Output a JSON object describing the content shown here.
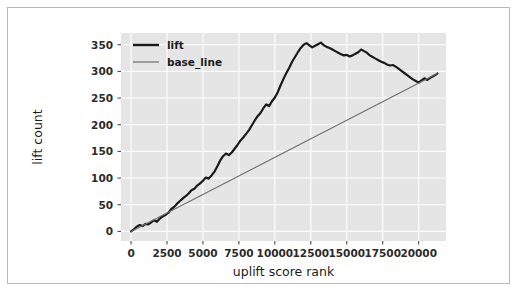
{
  "figure": {
    "background": "#ffffff",
    "border_color": "#b8bbbe",
    "plot_bg": "#e5e5e5",
    "grid_color": "#ffffff"
  },
  "ghost_text": "",
  "chart_data": {
    "type": "line",
    "title": "",
    "xlabel": "uplift score rank",
    "ylabel": "lift count",
    "xlim": [
      -700,
      21900
    ],
    "ylim": [
      -18,
      372
    ],
    "grid": true,
    "legend_position": "upper left",
    "xticks": [
      0,
      2500,
      5000,
      7500,
      10000,
      12500,
      15000,
      17500,
      20000
    ],
    "xtick_labels": [
      "0",
      "2500",
      "5000",
      "7500",
      "10000",
      "12500",
      "15000",
      "17500",
      "20000"
    ],
    "yticks": [
      0,
      50,
      100,
      150,
      200,
      250,
      300,
      350
    ],
    "ytick_labels": [
      "0",
      "50",
      "100",
      "150",
      "200",
      "250",
      "300",
      "350"
    ],
    "series": [
      {
        "name": "lift",
        "color": "#1a1a1a",
        "width": 2.2,
        "x": [
          0,
          200,
          400,
          600,
          800,
          1000,
          1200,
          1400,
          1600,
          1800,
          2000,
          2200,
          2400,
          2600,
          2800,
          3000,
          3200,
          3400,
          3600,
          3800,
          4000,
          4200,
          4400,
          4600,
          4800,
          5000,
          5200,
          5400,
          5600,
          5800,
          6000,
          6200,
          6400,
          6600,
          6800,
          7000,
          7200,
          7400,
          7600,
          7800,
          8000,
          8200,
          8400,
          8600,
          8800,
          9000,
          9200,
          9400,
          9600,
          9800,
          10000,
          10200,
          10400,
          10600,
          10800,
          11000,
          11200,
          11400,
          11600,
          11800,
          12000,
          12200,
          12400,
          12600,
          12800,
          13000,
          13200,
          13400,
          13600,
          13800,
          14000,
          14200,
          14400,
          14600,
          14800,
          15000,
          15200,
          15400,
          15600,
          15800,
          16000,
          16200,
          16400,
          16600,
          16800,
          17000,
          17200,
          17400,
          17600,
          17800,
          18000,
          18200,
          18400,
          18600,
          18800,
          19000,
          19200,
          19400,
          19600,
          19800,
          20000,
          20200,
          20400,
          20600,
          20800,
          21000,
          21200,
          21300
        ],
        "y": [
          0,
          4,
          9,
          12,
          10,
          14,
          13,
          17,
          21,
          18,
          24,
          28,
          31,
          35,
          42,
          46,
          52,
          57,
          62,
          66,
          71,
          77,
          80,
          86,
          90,
          95,
          101,
          99,
          105,
          112,
          122,
          133,
          141,
          146,
          143,
          148,
          155,
          162,
          170,
          176,
          183,
          190,
          199,
          208,
          216,
          222,
          231,
          238,
          235,
          244,
          251,
          261,
          274,
          286,
          297,
          307,
          318,
          327,
          336,
          344,
          350,
          353,
          349,
          345,
          348,
          351,
          354,
          349,
          346,
          344,
          341,
          338,
          335,
          332,
          330,
          331,
          328,
          330,
          333,
          336,
          341,
          338,
          335,
          330,
          327,
          324,
          321,
          318,
          316,
          313,
          311,
          312,
          309,
          305,
          301,
          297,
          293,
          289,
          285,
          282,
          279,
          283,
          287,
          284,
          288,
          291,
          294,
          296
        ]
      },
      {
        "name": "base_line",
        "color": "#6e6e6e",
        "width": 1.1,
        "x": [
          0,
          21300
        ],
        "y": [
          0,
          296
        ]
      }
    ]
  },
  "legend": {
    "entries": [
      {
        "label": "lift",
        "color": "#1a1a1a",
        "width": 2.4
      },
      {
        "label": "base_line",
        "color": "#6e6e6e",
        "width": 1.2
      }
    ]
  }
}
